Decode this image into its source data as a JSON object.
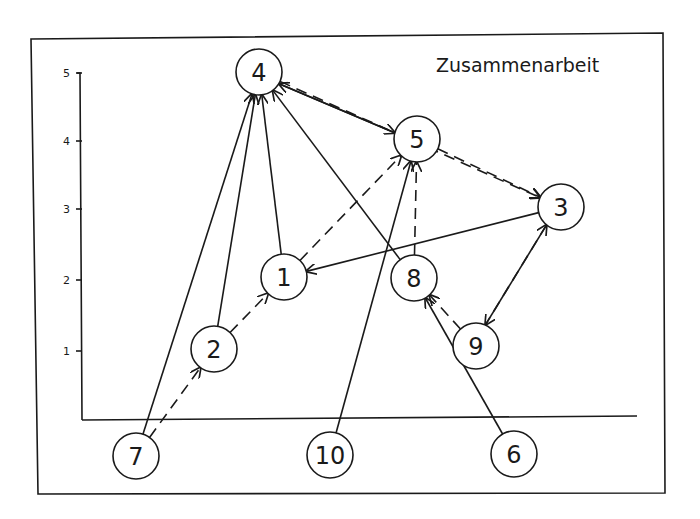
{
  "diagram": {
    "title": "Zusammenarbeit",
    "y_axis": {
      "ticks": [
        {
          "label": "5",
          "y": 73
        },
        {
          "label": "4",
          "y": 141
        },
        {
          "label": "3",
          "y": 209
        },
        {
          "label": "2",
          "y": 280
        },
        {
          "label": "1",
          "y": 351
        }
      ]
    },
    "nodes": [
      {
        "id": "4",
        "label": "4",
        "x": 259,
        "y": 72
      },
      {
        "id": "5",
        "label": "5",
        "x": 417,
        "y": 139
      },
      {
        "id": "3",
        "label": "3",
        "x": 561,
        "y": 207
      },
      {
        "id": "1",
        "label": "1",
        "x": 284,
        "y": 277
      },
      {
        "id": "8",
        "label": "8",
        "x": 414,
        "y": 278
      },
      {
        "id": "2",
        "label": "2",
        "x": 214,
        "y": 349
      },
      {
        "id": "9",
        "label": "9",
        "x": 476,
        "y": 346
      },
      {
        "id": "7",
        "label": "7",
        "x": 136,
        "y": 456
      },
      {
        "id": "10",
        "label": "10",
        "x": 330,
        "y": 455
      },
      {
        "id": "6",
        "label": "6",
        "x": 514,
        "y": 454
      }
    ],
    "edges": [
      {
        "from": "7",
        "to": "4",
        "style": "solid"
      },
      {
        "from": "2",
        "to": "4",
        "style": "solid"
      },
      {
        "from": "1",
        "to": "4",
        "style": "solid"
      },
      {
        "from": "8",
        "to": "4",
        "style": "solid"
      },
      {
        "from": "4",
        "to": "5",
        "style": "solid"
      },
      {
        "from": "5",
        "to": "4",
        "style": "solid"
      },
      {
        "from": "4",
        "to": "3",
        "style": "dashed"
      },
      {
        "from": "5",
        "to": "3",
        "style": "dashed"
      },
      {
        "from": "3",
        "to": "1",
        "style": "solid"
      },
      {
        "from": "1",
        "to": "5",
        "style": "dashed"
      },
      {
        "from": "8",
        "to": "5",
        "style": "dashed"
      },
      {
        "from": "10",
        "to": "5",
        "style": "solid"
      },
      {
        "from": "7",
        "to": "2",
        "style": "dashed"
      },
      {
        "from": "2",
        "to": "1",
        "style": "dashed"
      },
      {
        "from": "9",
        "to": "8",
        "style": "dashed"
      },
      {
        "from": "6",
        "to": "8",
        "style": "solid"
      },
      {
        "from": "3",
        "to": "9",
        "style": "dashed"
      },
      {
        "from": "9",
        "to": "3",
        "style": "solid"
      }
    ]
  }
}
